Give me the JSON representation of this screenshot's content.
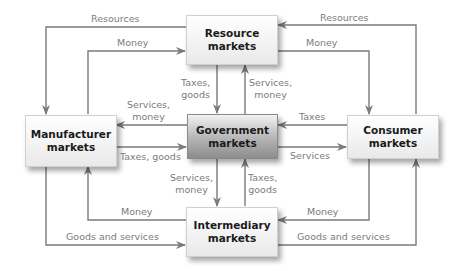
{
  "nodes": {
    "resource": {
      "line1": "Resource",
      "line2": "markets"
    },
    "government": {
      "line1": "Government",
      "line2": "markets"
    },
    "intermediary": {
      "line1": "Intermediary",
      "line2": "markets"
    },
    "manufacturer": {
      "line1": "Manufacturer",
      "line2": "markets"
    },
    "consumer": {
      "line1": "Consumer",
      "line2": "markets"
    }
  },
  "flows": {
    "resource_to_manufacturer": "Resources",
    "manufacturer_to_resource": "Money",
    "consumer_to_resource": "Resources",
    "resource_to_consumer": "Money",
    "resource_to_government": {
      "line1": "Taxes,",
      "line2": "goods"
    },
    "government_to_resource": {
      "line1": "Services,",
      "line2": "money"
    },
    "government_to_manufacturer": {
      "line1": "Services,",
      "line2": "money"
    },
    "manufacturer_to_government": "Taxes, goods",
    "consumer_to_government": "Taxes",
    "government_to_consumer": "Services",
    "government_to_intermediary": {
      "line1": "Services,",
      "line2": "money"
    },
    "intermediary_to_government": {
      "line1": "Taxes,",
      "line2": "goods"
    },
    "intermediary_to_manufacturer": "Money",
    "manufacturer_to_intermediary": "Goods and services",
    "consumer_to_intermediary": "Money",
    "intermediary_to_consumer": "Goods and services"
  },
  "colors": {
    "line": "#7a7a7a",
    "label": "#7b7b7b",
    "box_text": "#1a1a1a"
  }
}
